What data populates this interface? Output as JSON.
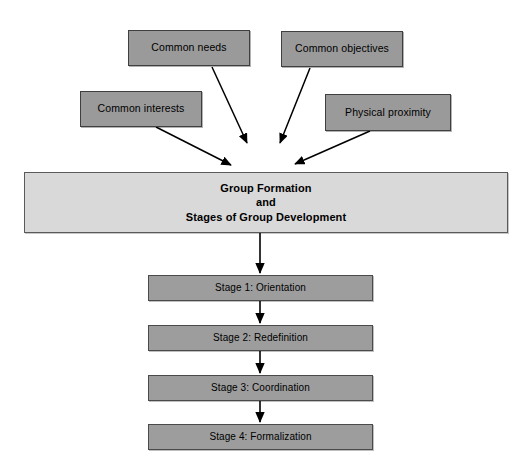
{
  "diagram": {
    "title": "Group Formation and Stages of Group Development",
    "colors": {
      "background": "#ffffff",
      "source_box_fill": "#9a9a9a",
      "stage_box_fill": "#9d9d9d",
      "hub_box_fill": "#d9d9d9",
      "border": "#4a4a4a",
      "arrow": "#000000",
      "text": "#000000"
    },
    "sources": [
      {
        "id": "common-needs",
        "label": "Common needs"
      },
      {
        "id": "common-objectives",
        "label": "Common objectives"
      },
      {
        "id": "common-interests",
        "label": "Common interests"
      },
      {
        "id": "physical-proximity",
        "label": "Physical proximity"
      }
    ],
    "hub": {
      "line1": "Group Formation",
      "line2": "and",
      "line3": "Stages of Group Development"
    },
    "stages": [
      {
        "id": "stage-1",
        "label": "Stage 1: Orientation"
      },
      {
        "id": "stage-2",
        "label": "Stage 2: Redefinition"
      },
      {
        "id": "stage-3",
        "label": "Stage 3: Coordination"
      },
      {
        "id": "stage-4",
        "label": "Stage 4: Formalization"
      }
    ]
  }
}
